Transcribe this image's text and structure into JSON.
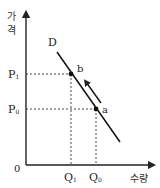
{
  "diagram": {
    "type": "demand-curve",
    "y_axis_label_line1": "가",
    "y_axis_label_line2": "격",
    "x_axis_label": "수량",
    "origin_label": "0",
    "curve_label": "D",
    "price_labels": {
      "p1_main": "P",
      "p1_sub": "1",
      "p0_main": "P",
      "p0_sub": "0"
    },
    "quantity_labels": {
      "q1_main": "Q",
      "q1_sub": "1",
      "q0_main": "Q",
      "q0_sub": "0"
    },
    "points": [
      {
        "name": "a",
        "label": "a"
      },
      {
        "name": "b",
        "label": "b"
      }
    ],
    "movement": "a → b along D (arrow)",
    "colors": {
      "line": "#111111",
      "axis": "#222222",
      "dashed": "#333333"
    }
  }
}
